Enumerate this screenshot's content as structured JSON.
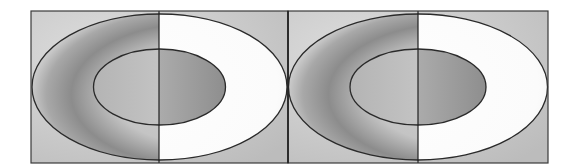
{
  "figure": {
    "type": "lightness-illusion-diagram",
    "panel_count": 2,
    "panels": [
      {
        "id": "left",
        "frame": {
          "x": 31,
          "y": 11,
          "width": 257,
          "height": 152
        },
        "divider_x": 159,
        "outer_ellipse": {
          "cx": 159.5,
          "cy": 87,
          "rx": 127.5,
          "ry": 73
        },
        "inner_ellipse": {
          "cx": 159.5,
          "cy": 87,
          "rx": 66,
          "ry": 38
        }
      },
      {
        "id": "right",
        "frame": {
          "x": 288,
          "y": 11,
          "width": 260,
          "height": 152
        },
        "divider_x": 418,
        "outer_ellipse": {
          "cx": 418,
          "cy": 87,
          "rx": 129.5,
          "ry": 73
        },
        "inner_ellipse": {
          "cx": 418,
          "cy": 87,
          "rx": 68,
          "ry": 38
        }
      }
    ],
    "colors": {
      "background": "#ffffff",
      "frame_fill": "#c8c8c8",
      "frame_light": "#dcdcdc",
      "crescent_dark": "#8a8a8a",
      "ring_white": "#fdfdfd",
      "inner_left": "#b9b9b9",
      "inner_right_light": "#bdbdbd",
      "inner_right_dark": "#8f8f8f",
      "stroke": "#2a2a2a"
    }
  }
}
